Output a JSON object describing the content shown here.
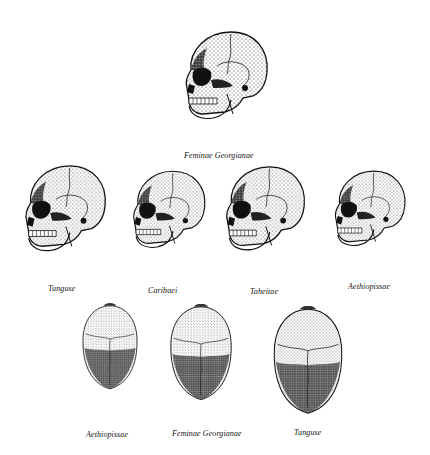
{
  "plate": {
    "title": "",
    "figures": {
      "top": {
        "label": "Feminae Georgianae",
        "view": "lateral"
      },
      "row2": [
        {
          "label": "Tunguse",
          "view": "lateral"
        },
        {
          "label": "Caribaei",
          "view": "lateral"
        },
        {
          "label": "Taheitae",
          "view": "lateral"
        },
        {
          "label": "Aethiopissae",
          "view": "lateral"
        }
      ],
      "row3": [
        {
          "label": "Aethiopissae",
          "view": "superior"
        },
        {
          "label": "Feminae Georgianae",
          "view": "superior"
        },
        {
          "label": "Tunguse",
          "view": "superior"
        }
      ]
    },
    "colors": {
      "ink": "#111111",
      "paper": "#ffffff",
      "shade": "#3a3a3a"
    }
  }
}
